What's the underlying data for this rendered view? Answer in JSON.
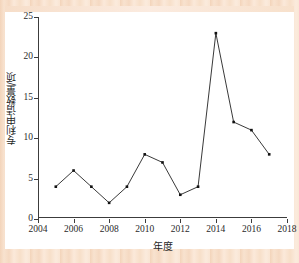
{
  "figure": {
    "background_color": "#f7dfc9",
    "plot_background_color": "#ffffff",
    "line_color": "#222222",
    "marker_color": "#111111",
    "axis_color": "#3c3c3c"
  },
  "chart_data": {
    "type": "line",
    "title": "",
    "subtitle": "",
    "xlabel": "年度",
    "ylabel": "专利申请数量/项",
    "xlim": [
      2004,
      2018
    ],
    "ylim": [
      0,
      25
    ],
    "grid": false,
    "legend": null,
    "legend_position": "none",
    "xticks": [
      2004,
      2006,
      2008,
      2010,
      2012,
      2014,
      2016,
      2018
    ],
    "xticklabels": [
      "2004",
      "2006",
      "2008",
      "2010",
      "2012",
      "2014",
      "2016",
      "2018"
    ],
    "yticks": [
      0,
      5,
      10,
      15,
      20,
      25
    ],
    "yticklabels": [
      "0",
      "5",
      "10",
      "15",
      "20",
      "25"
    ],
    "x": [
      2005,
      2006,
      2007,
      2008,
      2009,
      2010,
      2011,
      2012,
      2013,
      2014,
      2015,
      2016,
      2017
    ],
    "values": [
      4,
      6,
      4,
      2,
      4,
      8,
      7,
      3,
      4,
      23,
      12,
      11,
      8
    ],
    "series": [
      {
        "name": "专利申请数量",
        "marker": "square",
        "values": [
          4,
          6,
          4,
          2,
          4,
          8,
          7,
          3,
          4,
          23,
          12,
          11,
          8
        ]
      }
    ],
    "annotations": []
  }
}
